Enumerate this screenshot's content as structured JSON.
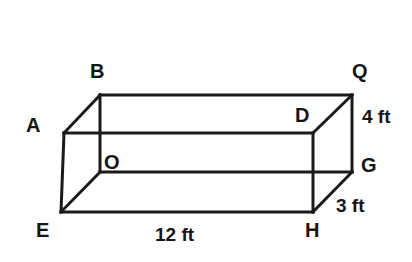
{
  "figure": {
    "kind": "rectangular-prism-wireframe",
    "background_color": "#ffffff",
    "line_color": "#1a1a1a",
    "text_color": "#141414",
    "vertices": {
      "A": {
        "label": "A",
        "x": 64,
        "y": 133,
        "label_x": 26,
        "label_y": 115
      },
      "B": {
        "label": "B",
        "x": 100,
        "y": 95,
        "label_x": 90,
        "label_y": 61
      },
      "D": {
        "label": "D",
        "x": 313,
        "y": 133,
        "label_x": 295,
        "label_y": 105
      },
      "Q": {
        "label": "Q",
        "x": 352,
        "y": 95,
        "label_x": 352,
        "label_y": 61
      },
      "E": {
        "label": "E",
        "x": 61,
        "y": 212,
        "label_x": 36,
        "label_y": 220
      },
      "O": {
        "label": "O",
        "x": 100,
        "y": 172,
        "label_x": 104,
        "label_y": 152
      },
      "H": {
        "label": "H",
        "x": 313,
        "y": 212,
        "label_x": 305,
        "label_y": 220
      },
      "G": {
        "label": "G",
        "x": 352,
        "y": 172,
        "label_x": 361,
        "label_y": 155
      }
    },
    "dimensions": [
      {
        "name": "length",
        "value": "12 ft",
        "label_x": 155,
        "label_y": 225
      },
      {
        "name": "height",
        "value": "4 ft",
        "label_x": 362,
        "label_y": 107
      },
      {
        "name": "depth",
        "value": "3 ft",
        "label_x": 336,
        "label_y": 196
      }
    ],
    "edges": [
      {
        "name": "edge-A-B",
        "from": "A",
        "to": "B"
      },
      {
        "name": "edge-B-Q",
        "from": "B",
        "to": "Q"
      },
      {
        "name": "edge-Q-D",
        "from": "Q",
        "to": "D"
      },
      {
        "name": "edge-D-A",
        "from": "D",
        "to": "A"
      },
      {
        "name": "edge-E-O",
        "from": "E",
        "to": "O"
      },
      {
        "name": "edge-O-G",
        "from": "O",
        "to": "G"
      },
      {
        "name": "edge-G-H",
        "from": "G",
        "to": "H"
      },
      {
        "name": "edge-H-E",
        "from": "H",
        "to": "E"
      },
      {
        "name": "edge-A-E",
        "from": "A",
        "to": "E"
      },
      {
        "name": "edge-B-O",
        "from": "B",
        "to": "O"
      },
      {
        "name": "edge-Q-G",
        "from": "Q",
        "to": "G"
      },
      {
        "name": "edge-D-H",
        "from": "D",
        "to": "H"
      }
    ]
  }
}
